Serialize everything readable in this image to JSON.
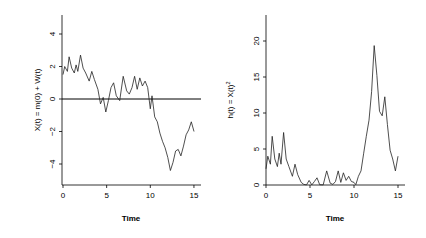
{
  "chart_data": [
    {
      "type": "line",
      "title": "",
      "xlabel": "Time",
      "ylabel": "X(t) = m(0) + W(t)",
      "xlim": [
        0,
        15.5
      ],
      "ylim": [
        -5.2,
        5.2
      ],
      "x_ticks": [
        0,
        5,
        10,
        15
      ],
      "y_ticks": [
        -4,
        -2,
        0,
        2,
        4
      ],
      "grid": false,
      "reference_line": {
        "y": 0
      },
      "series": [
        {
          "name": "X(t)",
          "x": [
            0,
            0.2,
            0.5,
            0.7,
            1.0,
            1.3,
            1.5,
            1.7,
            2.0,
            2.3,
            2.6,
            3.0,
            3.3,
            3.6,
            4.0,
            4.3,
            4.6,
            4.9,
            5.2,
            5.5,
            5.8,
            6.1,
            6.5,
            6.9,
            7.3,
            7.6,
            7.9,
            8.2,
            8.5,
            8.8,
            9.1,
            9.4,
            9.7,
            10.0,
            10.2,
            10.5,
            10.8,
            11.1,
            11.4,
            11.7,
            12.0,
            12.3,
            12.6,
            12.9,
            13.2,
            13.5,
            13.8,
            14.1,
            14.4,
            14.7,
            15.0
          ],
          "values": [
            1.5,
            2.0,
            1.7,
            2.6,
            1.9,
            1.6,
            2.1,
            1.7,
            2.7,
            1.9,
            1.6,
            1.1,
            1.7,
            1.2,
            0.6,
            -0.3,
            0.1,
            -0.8,
            -0.1,
            0.7,
            1.0,
            0.2,
            -0.1,
            1.4,
            0.5,
            0.3,
            0.7,
            1.4,
            0.6,
            1.3,
            0.8,
            1.1,
            0.7,
            -0.6,
            0.2,
            -1.1,
            -1.4,
            -2.1,
            -2.6,
            -3.0,
            -3.6,
            -4.4,
            -3.9,
            -3.2,
            -3.1,
            -3.5,
            -2.9,
            -2.2,
            -1.9,
            -1.4,
            -2.0
          ]
        }
      ]
    },
    {
      "type": "line",
      "title": "",
      "xlabel": "Time",
      "ylabel": "h(t) = X(t)^2",
      "xlim": [
        0,
        15.5
      ],
      "ylim": [
        0,
        23.5
      ],
      "x_ticks": [
        0,
        5,
        10,
        15
      ],
      "y_ticks": [
        0,
        5,
        10,
        15,
        20
      ],
      "grid": false,
      "series": [
        {
          "name": "h(t)",
          "x": [
            0,
            0.2,
            0.5,
            0.7,
            1.0,
            1.3,
            1.5,
            1.7,
            2.0,
            2.3,
            2.6,
            3.0,
            3.3,
            3.6,
            4.0,
            4.3,
            4.6,
            4.9,
            5.2,
            5.5,
            5.8,
            6.1,
            6.5,
            6.9,
            7.3,
            7.6,
            7.9,
            8.2,
            8.5,
            8.8,
            9.1,
            9.4,
            9.7,
            10.0,
            10.2,
            10.5,
            10.8,
            11.1,
            11.4,
            11.7,
            12.0,
            12.3,
            12.6,
            12.9,
            13.2,
            13.5,
            13.8,
            14.1,
            14.4,
            14.7,
            15.0
          ],
          "values": [
            2.25,
            4.0,
            2.89,
            6.76,
            3.61,
            2.56,
            4.41,
            2.89,
            7.29,
            3.61,
            2.56,
            1.21,
            2.89,
            1.44,
            0.36,
            0.09,
            0.01,
            0.64,
            0.01,
            0.49,
            1.0,
            0.04,
            0.01,
            1.96,
            0.25,
            0.09,
            0.49,
            1.96,
            0.36,
            1.69,
            0.64,
            1.21,
            0.49,
            0.36,
            0.04,
            1.21,
            1.96,
            4.41,
            6.76,
            9.0,
            12.96,
            19.36,
            15.21,
            10.24,
            9.61,
            12.25,
            8.41,
            4.84,
            3.61,
            1.96,
            4.0
          ]
        }
      ]
    }
  ],
  "plots": {
    "left": {
      "ylabel": "X(t) = m(0) + W(t)",
      "xlabel": "Time",
      "x_tick_labels": [
        "0",
        "5",
        "10",
        "15"
      ],
      "y_tick_labels": [
        "4",
        "2",
        "0",
        "-2",
        "-4"
      ]
    },
    "right": {
      "ylabel": "h(t) = X(t)",
      "ylabel_sup": "2",
      "xlabel": "Time",
      "x_tick_labels": [
        "0",
        "5",
        "10",
        "15"
      ],
      "y_tick_labels": [
        "20",
        "15",
        "10",
        "5",
        "0"
      ]
    }
  }
}
